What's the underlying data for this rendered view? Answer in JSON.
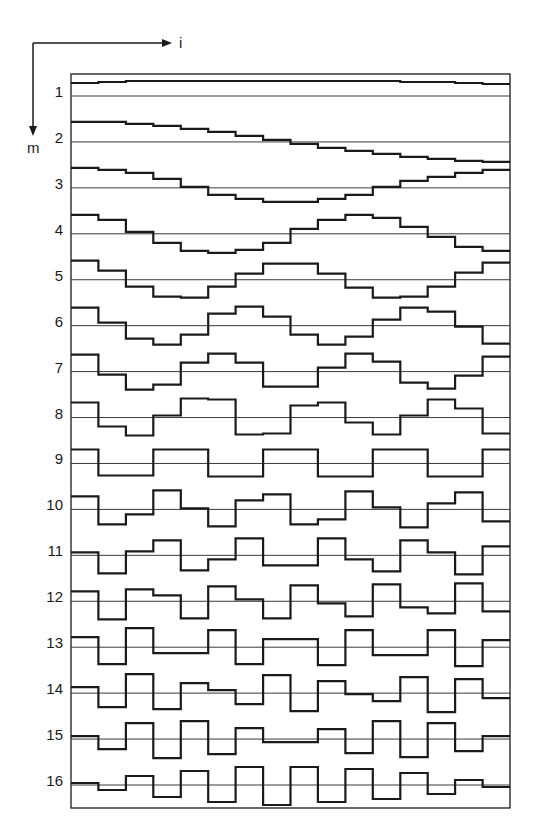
{
  "figure": {
    "type": "basis-function-diagram",
    "axes": {
      "horizontal_label": "i",
      "vertical_label": "m"
    },
    "colors": {
      "background": "#ffffff",
      "line": "#1a1a1a",
      "baseline": "#3a3a3a"
    },
    "columns": 16,
    "row_labels": [
      "1",
      "2",
      "3",
      "4",
      "5",
      "6",
      "7",
      "8",
      "9",
      "10",
      "11",
      "12",
      "13",
      "14",
      "15",
      "16"
    ],
    "rows": [
      {
        "m": 1,
        "values": [
          13,
          14,
          15,
          15,
          15,
          15,
          15,
          15,
          15,
          15,
          15,
          15,
          14,
          14,
          13,
          12
        ]
      },
      {
        "m": 2,
        "values": [
          20,
          20,
          18,
          16,
          13,
          10,
          6,
          2,
          -2,
          -6,
          -9,
          -12,
          -15,
          -17,
          -19,
          -20
        ]
      },
      {
        "m": 3,
        "values": [
          20,
          18,
          15,
          9,
          1,
          -7,
          -11,
          -14,
          -14,
          -11,
          -7,
          1,
          7,
          11,
          15,
          18
        ]
      },
      {
        "m": 4,
        "values": [
          19,
          14,
          2,
          -9,
          -17,
          -19,
          -16,
          -9,
          5,
          14,
          19,
          16,
          7,
          -3,
          -13,
          -17
        ]
      },
      {
        "m": 5,
        "values": [
          19,
          9,
          -7,
          -17,
          -18,
          -7,
          6,
          16,
          16,
          6,
          -8,
          -18,
          -17,
          -7,
          7,
          17
        ]
      },
      {
        "m": 6,
        "values": [
          18,
          3,
          -13,
          -19,
          -9,
          12,
          19,
          9,
          -9,
          -19,
          -11,
          6,
          18,
          14,
          -1,
          -18
        ]
      },
      {
        "m": 7,
        "values": [
          17,
          -3,
          -18,
          -13,
          9,
          18,
          9,
          -15,
          -15,
          4,
          18,
          10,
          -11,
          -17,
          -4,
          15
        ]
      },
      {
        "m": 8,
        "values": [
          15,
          -9,
          -18,
          2,
          19,
          18,
          -17,
          -16,
          12,
          15,
          -5,
          -17,
          2,
          18,
          9,
          -16
        ]
      },
      {
        "m": 9,
        "values": [
          14,
          -12,
          -12,
          14,
          14,
          -13,
          -13,
          14,
          14,
          -13,
          -13,
          14,
          14,
          -13,
          -13,
          14
        ]
      },
      {
        "m": 10,
        "values": [
          13,
          -15,
          -5,
          19,
          1,
          -17,
          9,
          15,
          -15,
          -10,
          18,
          2,
          -18,
          6,
          17,
          -12
        ]
      },
      {
        "m": 11,
        "values": [
          3,
          -18,
          4,
          15,
          -15,
          -4,
          17,
          -10,
          -10,
          17,
          -4,
          -16,
          15,
          3,
          -19,
          9
        ]
      },
      {
        "m": 12,
        "values": [
          10,
          -18,
          12,
          6,
          -17,
          15,
          2,
          -17,
          16,
          -2,
          -15,
          17,
          -6,
          -12,
          18,
          -10
        ]
      },
      {
        "m": 13,
        "values": [
          10,
          -17,
          19,
          -6,
          -6,
          17,
          -17,
          8,
          8,
          -18,
          17,
          -8,
          -8,
          17,
          -19,
          7
        ]
      },
      {
        "m": 14,
        "values": [
          6,
          -14,
          19,
          -16,
          10,
          3,
          -11,
          18,
          -18,
          12,
          -1,
          -8,
          16,
          -19,
          14,
          -5
        ]
      },
      {
        "m": 15,
        "values": [
          3,
          -10,
          16,
          -19,
          18,
          -15,
          11,
          -3,
          -3,
          10,
          -14,
          18,
          -18,
          16,
          -12,
          3
        ]
      },
      {
        "m": 16,
        "values": [
          2,
          -5,
          9,
          -12,
          14,
          -17,
          18,
          -20,
          18,
          -17,
          16,
          -14,
          12,
          -9,
          5,
          -2
        ]
      }
    ]
  }
}
